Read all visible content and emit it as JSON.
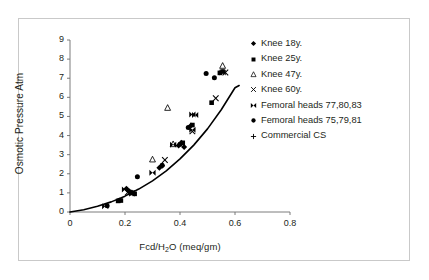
{
  "figure": {
    "background": "#ffffff",
    "border_color": "#c9c9c9",
    "ink_color": "#231f20"
  },
  "chart_data": {
    "type": "scatter",
    "title": "",
    "xlabel": "Fcd/H2O (meq/gm)",
    "xlabel_prefix": "Fcd/H",
    "xlabel_sub": "2",
    "xlabel_suffix": "O (meq/gm)",
    "ylabel": "Osmotic Pressure Atm",
    "xlim": [
      0,
      0.8
    ],
    "ylim": [
      0,
      9
    ],
    "xticks": [
      "0",
      "0.2",
      "0.4",
      "0.6",
      "0.8"
    ],
    "xtick_values": [
      0,
      0.2,
      0.4,
      0.6,
      0.8
    ],
    "yticks": [
      "0",
      "1",
      "2",
      "3",
      "4",
      "5",
      "6",
      "7",
      "8",
      "9"
    ],
    "ytick_values": [
      0,
      1,
      2,
      3,
      4,
      5,
      6,
      7,
      8,
      9
    ],
    "grid": false,
    "legend_position": "right",
    "fit_curve": {
      "label": "",
      "color": "#000000",
      "width": 1.6,
      "points": [
        [
          0.0,
          0.0
        ],
        [
          0.05,
          0.12
        ],
        [
          0.1,
          0.3
        ],
        [
          0.15,
          0.53
        ],
        [
          0.2,
          0.83
        ],
        [
          0.25,
          1.2
        ],
        [
          0.3,
          1.63
        ],
        [
          0.35,
          2.15
        ],
        [
          0.4,
          2.78
        ],
        [
          0.45,
          3.5
        ],
        [
          0.5,
          4.35
        ],
        [
          0.55,
          5.35
        ],
        [
          0.6,
          6.5
        ],
        [
          0.615,
          6.62
        ]
      ]
    },
    "series": [
      {
        "name": "Knee 18y.",
        "marker": "diamond",
        "color": "#000000",
        "points": [
          [
            0.205,
            1.22
          ],
          [
            0.215,
            1.08
          ],
          [
            0.225,
            1.02
          ],
          [
            0.325,
            2.32
          ],
          [
            0.335,
            2.42
          ],
          [
            0.395,
            3.48
          ],
          [
            0.405,
            3.62
          ],
          [
            0.415,
            3.4
          ],
          [
            0.44,
            4.52
          ]
        ]
      },
      {
        "name": "Knee 25y.",
        "marker": "square",
        "color": "#000000",
        "points": [
          [
            0.175,
            0.58
          ],
          [
            0.185,
            0.6
          ],
          [
            0.225,
            1.0
          ],
          [
            0.235,
            0.95
          ],
          [
            0.41,
            3.62
          ],
          [
            0.445,
            4.55
          ],
          [
            0.515,
            5.72
          ],
          [
            0.545,
            7.28
          ],
          [
            0.555,
            7.35
          ]
        ]
      },
      {
        "name": "Knee 47y.",
        "marker": "triangle-open",
        "color": "#000000",
        "points": [
          [
            0.3,
            2.75
          ],
          [
            0.355,
            5.45
          ],
          [
            0.375,
            3.55
          ],
          [
            0.555,
            7.65
          ]
        ]
      },
      {
        "name": "Knee 60y.",
        "marker": "cross",
        "color": "#000000",
        "points": [
          [
            0.21,
            1.02
          ],
          [
            0.225,
            0.98
          ],
          [
            0.345,
            2.72
          ],
          [
            0.445,
            4.22
          ],
          [
            0.53,
            5.95
          ],
          [
            0.565,
            7.3
          ]
        ]
      },
      {
        "name": "Femoral heads 77,80,83",
        "marker": "bowtie",
        "color": "#000000",
        "points": [
          [
            0.128,
            0.3
          ],
          [
            0.2,
            1.18
          ],
          [
            0.3,
            2.05
          ],
          [
            0.375,
            3.52
          ],
          [
            0.445,
            5.1
          ],
          [
            0.455,
            5.08
          ],
          [
            0.445,
            4.3
          ],
          [
            0.555,
            7.3
          ]
        ]
      },
      {
        "name": "Femoral heads 75,79,81",
        "marker": "circle",
        "color": "#000000",
        "points": [
          [
            0.135,
            0.33
          ],
          [
            0.18,
            0.62
          ],
          [
            0.245,
            1.85
          ],
          [
            0.335,
            2.45
          ],
          [
            0.4,
            3.55
          ],
          [
            0.43,
            4.42
          ],
          [
            0.495,
            7.25
          ],
          [
            0.525,
            7.02
          ]
        ]
      },
      {
        "name": "Commercial CS",
        "marker": "plus",
        "color": "#000000",
        "points": []
      }
    ]
  },
  "legend": {
    "items": [
      {
        "label": "Knee 18y.",
        "marker": "diamond"
      },
      {
        "label": "Knee 25y.",
        "marker": "square"
      },
      {
        "label": "Knee 47y.",
        "marker": "triangle-open"
      },
      {
        "label": "Knee 60y.",
        "marker": "cross"
      },
      {
        "label": "Femoral heads 77,80,83",
        "marker": "bowtie"
      },
      {
        "label": "Femoral heads 75,79,81",
        "marker": "circle"
      },
      {
        "label": "Commercial CS",
        "marker": "plus"
      }
    ]
  }
}
